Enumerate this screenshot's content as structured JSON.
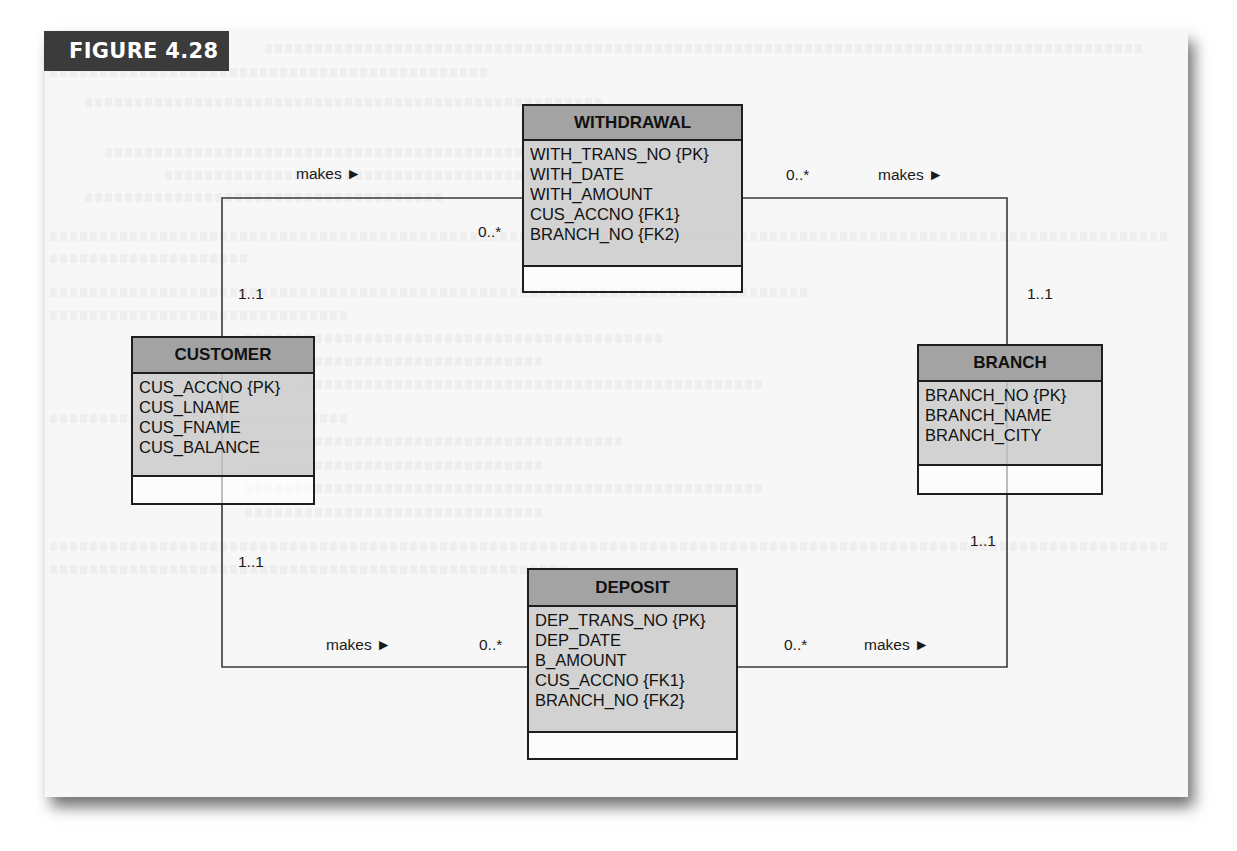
{
  "figure": {
    "label": "FIGURE 4.28"
  },
  "entities": {
    "withdrawal": {
      "name": "WITHDRAWAL",
      "attributes": [
        "WITH_TRANS_NO {PK}",
        "WITH_DATE",
        "WITH_AMOUNT",
        "CUS_ACCNO {FK1}",
        "BRANCH_NO {FK2)"
      ]
    },
    "customer": {
      "name": "CUSTOMER",
      "attributes": [
        "CUS_ACCNO {PK}",
        "CUS_LNAME",
        "CUS_FNAME",
        "CUS_BALANCE"
      ]
    },
    "branch": {
      "name": "BRANCH",
      "attributes": [
        "BRANCH_NO {PK}",
        "BRANCH_NAME",
        "BRANCH_CITY"
      ]
    },
    "deposit": {
      "name": "DEPOSIT",
      "attributes": [
        "DEP_TRANS_NO {PK}",
        "DEP_DATE",
        "B_AMOUNT",
        "CUS_ACCNO {FK1}",
        "BRANCH_NO {FK2}"
      ]
    }
  },
  "relationships": {
    "customer_withdrawal": {
      "verb": "makes ►",
      "from_mult": "1..1",
      "to_mult": "0..*"
    },
    "branch_withdrawal": {
      "verb": "makes ►",
      "from_mult": "1..1",
      "to_mult": "0..*"
    },
    "customer_deposit": {
      "verb": "makes ►",
      "from_mult": "1..1",
      "to_mult": "0..*"
    },
    "branch_deposit": {
      "verb": "makes ►",
      "from_mult": "1..1",
      "to_mult": "0..*"
    }
  },
  "colors": {
    "header_fill": "#a3a3a3",
    "body_fill": "#cdcdcd",
    "border": "#1e1e1e",
    "figure_label_bg": "#3b3b3b",
    "panel_bg": "#f7f7f7"
  }
}
